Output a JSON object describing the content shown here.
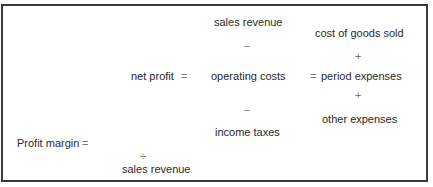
{
  "diagram": {
    "net_profit_label": "net profit",
    "equals": "=",
    "minus": "–",
    "plus": "+",
    "divide": "÷",
    "sales_revenue_top": "sales revenue",
    "operating_costs": "operating costs",
    "income_taxes": "income taxes",
    "cost_of_goods_sold": "cost of goods sold",
    "period_expenses": "period expenses",
    "other_expenses": "other expenses",
    "profit_margin_label": "Profit margin",
    "sales_revenue_bottom": "sales revenue"
  }
}
